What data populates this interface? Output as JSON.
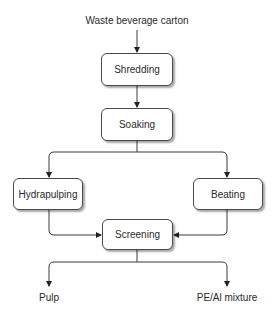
{
  "diagram": {
    "type": "flowchart",
    "input_label": "Waste beverage carton",
    "nodes": [
      {
        "id": "shredding",
        "label": "Shredding"
      },
      {
        "id": "soaking",
        "label": "Soaking"
      },
      {
        "id": "hydrapulping",
        "label": "Hydrapulping"
      },
      {
        "id": "beating",
        "label": "Beating"
      },
      {
        "id": "screening",
        "label": "Screening"
      }
    ],
    "outputs": [
      {
        "id": "pulp",
        "label": "Pulp"
      },
      {
        "id": "pe-al-mixture",
        "label": "PE/Al mixture"
      }
    ],
    "edges": [
      {
        "from": "input",
        "to": "shredding"
      },
      {
        "from": "shredding",
        "to": "soaking"
      },
      {
        "from": "soaking",
        "to": "hydrapulping"
      },
      {
        "from": "soaking",
        "to": "beating"
      },
      {
        "from": "hydrapulping",
        "to": "screening"
      },
      {
        "from": "beating",
        "to": "screening"
      },
      {
        "from": "screening",
        "to": "pulp"
      },
      {
        "from": "screening",
        "to": "pe-al-mixture"
      }
    ],
    "colors": {
      "line": "#3a3a3a",
      "box_border": "#4a4a4a",
      "box_fill": "#ffffff",
      "text": "#2a2a2a"
    }
  }
}
